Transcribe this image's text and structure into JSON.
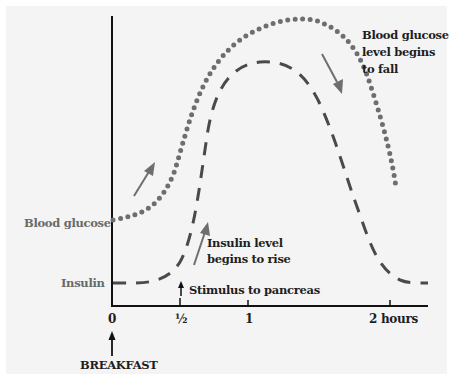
{
  "diagram": {
    "y_labels": {
      "blood_glucose": "Blood glucose",
      "insulin": "Insulin"
    },
    "x_ticks": [
      {
        "label": "0",
        "x": 0
      },
      {
        "label": "½",
        "x": 0.5
      },
      {
        "label": "1",
        "x": 1
      },
      {
        "label": "2 hours",
        "x": 2
      }
    ],
    "annotations": {
      "breakfast": "BREAKFAST",
      "stimulus": "Stimulus to pancreas",
      "insulin_rise_line1": "Insulin level",
      "insulin_rise_line2": "begins to rise",
      "glucose_fall_line1": "Blood glucose",
      "glucose_fall_line2": "level begins",
      "glucose_fall_line3": "to fall"
    },
    "series": [
      {
        "name": "Blood glucose",
        "style": "dotted",
        "color": "#6e6e6e"
      },
      {
        "name": "Insulin",
        "style": "dashed",
        "color": "#4a4a4a"
      }
    ],
    "colors": {
      "axis": "#111111",
      "background": "#f4f4f4",
      "arrow": "#6e6e6e"
    }
  }
}
